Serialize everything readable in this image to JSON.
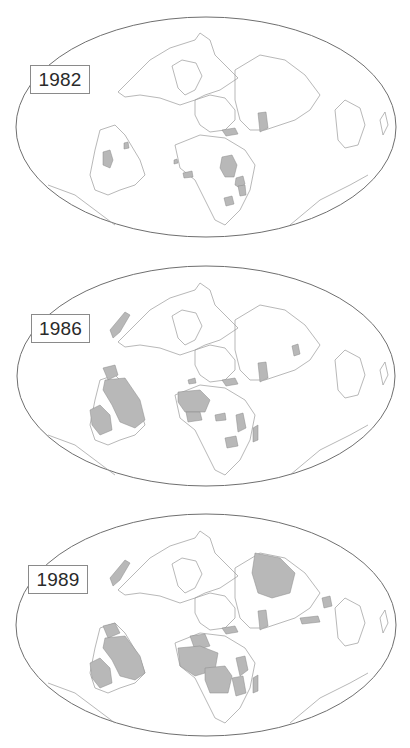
{
  "figure": {
    "colors": {
      "outline": "#6f6f6f",
      "land_border": "#9a9a9a",
      "shaded": "#b8b8b8",
      "background": "#ffffff"
    }
  },
  "maps": [
    {
      "year": "1982",
      "shaded_regions": [
        "Argentina/Paraguay region",
        "Bolivia area",
        "Senegal/Gambia",
        "Ghana/Côte d'Ivoire",
        "Sudan",
        "Tanzania",
        "Mozambique/Malawi",
        "Zambia/Zimbabwe",
        "Turkey",
        "Pakistan",
        "Balkans"
      ]
    },
    {
      "year": "1986",
      "shaded_regions": [
        "Mexico",
        "Peru",
        "Brazil",
        "Argentina",
        "Bolivia/Chile",
        "Senegal",
        "Mali",
        "Niger",
        "Nigeria",
        "Ghana",
        "Morocco",
        "Central African Rep.",
        "Tanzania",
        "Zambia",
        "Madagascar",
        "Turkey",
        "Pakistan",
        "Philippines",
        "Balkans"
      ]
    },
    {
      "year": "1989",
      "shaded_regions": [
        "Mexico",
        "Venezuela",
        "Peru",
        "Brazil",
        "Argentina",
        "Bolivia",
        "Algeria",
        "Mali",
        "Niger",
        "Nigeria",
        "Chad",
        "Congo/Zaire",
        "Kenya",
        "Tanzania",
        "Zambia",
        "Madagascar",
        "Turkey",
        "Pakistan",
        "China",
        "Philippines",
        "Indonesia",
        "Balkans"
      ]
    }
  ]
}
